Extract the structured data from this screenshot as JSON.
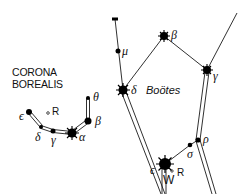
{
  "diagram": {
    "colors": {
      "line": "#1a1a1a",
      "star": "#000000",
      "background": "#ffffff"
    }
  },
  "constellations": {
    "corona_borealis": {
      "name_line1": "CORONA",
      "name_line2": "BOREALIS",
      "stars": [
        {
          "id": "theta",
          "label": "θ"
        },
        {
          "id": "beta",
          "label": "β"
        },
        {
          "id": "alpha",
          "label": "α"
        },
        {
          "id": "gamma",
          "label": "γ"
        },
        {
          "id": "delta",
          "label": "δ"
        },
        {
          "id": "epsilon",
          "label": "ϵ"
        },
        {
          "id": "R",
          "label": "R"
        }
      ]
    },
    "bootes": {
      "name": "Boötes",
      "stars": [
        {
          "id": "mu",
          "label": "μ"
        },
        {
          "id": "beta",
          "label": "β"
        },
        {
          "id": "delta",
          "label": "δ"
        },
        {
          "id": "gamma",
          "label": "γ"
        },
        {
          "id": "epsilon",
          "label": "ϵ"
        },
        {
          "id": "sigma",
          "label": "σ"
        },
        {
          "id": "rho",
          "label": "ρ"
        },
        {
          "id": "W",
          "label": "W"
        },
        {
          "id": "R",
          "label": "R"
        }
      ]
    }
  }
}
